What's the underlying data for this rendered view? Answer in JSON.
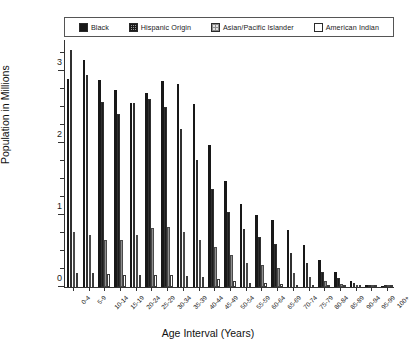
{
  "chart_data": {
    "type": "bar",
    "title": "",
    "xlabel": "Age Interval (Years)",
    "ylabel": "Population in Millions",
    "ylim": [
      0,
      3.45
    ],
    "yticks": [
      0,
      1,
      2,
      3
    ],
    "ytick_labels": [
      "0",
      "1",
      "2",
      "3"
    ],
    "yminor_step": 0.25,
    "grid": false,
    "legend_position": "top",
    "categories": [
      "0-4",
      "5-9",
      "10-14",
      "15-19",
      "20-24",
      "25-29",
      "30-34",
      "35-39",
      "40-44",
      "45-49",
      "50-54",
      "55-59",
      "60-64",
      "65-69",
      "70-74",
      "75-79",
      "80-84",
      "85-89",
      "90-94",
      "95-99",
      "100+"
    ],
    "series": [
      {
        "name": "Black",
        "fill": "solid-black",
        "color": "#181818",
        "values": [
          2.9,
          3.16,
          2.88,
          2.74,
          2.56,
          2.7,
          2.86,
          2.82,
          2.55,
          1.97,
          1.48,
          1.16,
          1.0,
          0.93,
          0.8,
          0.58,
          0.38,
          0.21,
          0.09,
          0.03,
          0.01
        ]
      },
      {
        "name": "Hispanic Origin",
        "fill": "dense-dot",
        "color": "#9a9a9a",
        "values": [
          3.3,
          2.95,
          2.57,
          2.4,
          2.56,
          2.62,
          2.5,
          2.2,
          1.76,
          1.36,
          1.05,
          0.81,
          0.69,
          0.6,
          0.48,
          0.33,
          0.21,
          0.12,
          0.05,
          0.02,
          0.01
        ]
      },
      {
        "name": "Asian/Pacific Islander",
        "fill": "light-hatch",
        "color": "#e2e2e2",
        "values": [
          0.77,
          0.72,
          0.66,
          0.66,
          0.73,
          0.82,
          0.83,
          0.77,
          0.66,
          0.55,
          0.44,
          0.34,
          0.3,
          0.26,
          0.2,
          0.14,
          0.08,
          0.04,
          0.02,
          0.01,
          0.0
        ]
      },
      {
        "name": "American Indian",
        "fill": "white",
        "color": "#ffffff",
        "values": [
          0.2,
          0.19,
          0.18,
          0.17,
          0.17,
          0.17,
          0.17,
          0.16,
          0.14,
          0.11,
          0.08,
          0.06,
          0.05,
          0.04,
          0.03,
          0.02,
          0.01,
          0.01,
          0.0,
          0.0,
          0.0
        ]
      }
    ]
  },
  "legend": {
    "items": [
      {
        "label": "Black",
        "swatch": "sw-black"
      },
      {
        "label": "Hispanic Origin",
        "swatch": "sw-hisp"
      },
      {
        "label": "Asian/Pacific Islander",
        "swatch": "sw-asian"
      },
      {
        "label": "American Indian",
        "swatch": "sw-amind"
      }
    ]
  }
}
